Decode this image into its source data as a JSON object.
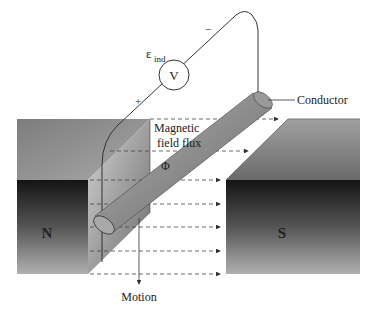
{
  "diagram": {
    "labels": {
      "emf_symbol": "ε",
      "emf_subscript": "ind",
      "voltmeter": "V",
      "minus": "−",
      "plus": "+",
      "conductor": "Conductor",
      "flux_line1": "Magnetic",
      "flux_line2": "field flux",
      "flux_symbol": "Φ",
      "north_pole": "N",
      "south_pole": "S",
      "motion": "Motion"
    },
    "colors": {
      "background": "#ffffff",
      "magnet_top_light": "#9a9a9a",
      "magnet_top_dark": "#6e6e6e",
      "magnet_front_dark": "#1c1c1c",
      "magnet_front_light": "#9c9c9c",
      "conductor_fill": "#8a8a8a",
      "wire": "#333333",
      "flux_dash": "#444444"
    },
    "flux_lines_y": [
      119,
      151,
      180,
      204,
      227,
      251,
      274
    ]
  }
}
